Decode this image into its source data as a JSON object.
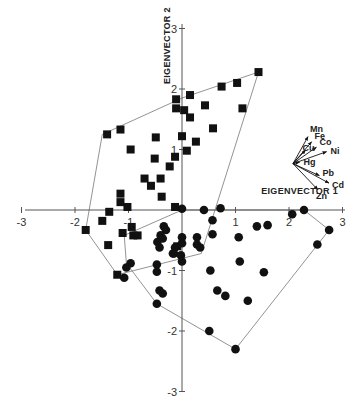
{
  "chart_data": {
    "type": "scatter",
    "title": "",
    "xlabel": "EIGENVECTOR 1",
    "ylabel": "EIGENVECTOR 2",
    "xlim": [
      -3,
      3
    ],
    "ylim": [
      -3,
      3
    ],
    "x_ticks": [
      "-3",
      "-2",
      "-1",
      "1",
      "2",
      "3"
    ],
    "y_ticks": [
      "3",
      "2",
      "1",
      "-1",
      "-2",
      "-3"
    ],
    "grid": false,
    "legend": null,
    "series": [
      {
        "name": "group-squares",
        "marker": "square",
        "points": [
          [
            1.43,
            2.28
          ],
          [
            1.03,
            2.1
          ],
          [
            0.74,
            2.04
          ],
          [
            0.15,
            1.9
          ],
          [
            0.43,
            1.73
          ],
          [
            1.13,
            1.68
          ],
          [
            0.04,
            1.65
          ],
          [
            0.15,
            1.53
          ],
          [
            0.58,
            1.35
          ],
          [
            0.0,
            1.22
          ],
          [
            0.26,
            1.13
          ],
          [
            0.09,
            0.98
          ],
          [
            -0.11,
            1.83
          ],
          [
            -0.11,
            1.68
          ],
          [
            -1.4,
            1.25
          ],
          [
            -1.15,
            1.33
          ],
          [
            -0.49,
            1.2
          ],
          [
            -0.96,
            1.0
          ],
          [
            -0.51,
            0.85
          ],
          [
            -0.13,
            0.88
          ],
          [
            -0.23,
            0.72
          ],
          [
            -0.7,
            0.52
          ],
          [
            -0.58,
            0.4
          ],
          [
            -0.4,
            0.52
          ],
          [
            -0.38,
            0.22
          ],
          [
            -1.15,
            0.27
          ],
          [
            -1.15,
            0.13
          ],
          [
            -1.02,
            0.05
          ],
          [
            -1.36,
            -0.03
          ],
          [
            -0.13,
            0.05
          ],
          [
            -1.49,
            -0.18
          ],
          [
            -1.8,
            -0.33
          ],
          [
            -0.94,
            -0.28
          ],
          [
            -0.91,
            -0.42
          ],
          [
            -0.83,
            -0.42
          ],
          [
            -1.11,
            -0.38
          ],
          [
            -1.38,
            -0.58
          ],
          [
            -1.21,
            -1.07
          ],
          [
            -0.09,
            -0.6
          ]
        ]
      },
      {
        "name": "group-circles",
        "marker": "circle",
        "points": [
          [
            0.0,
            0.02
          ],
          [
            0.41,
            0.0
          ],
          [
            0.72,
            0.03
          ],
          [
            2.06,
            -0.07
          ],
          [
            2.28,
            0.0
          ],
          [
            2.75,
            -0.33
          ],
          [
            2.53,
            -0.57
          ],
          [
            1.4,
            -0.27
          ],
          [
            1.6,
            -0.25
          ],
          [
            0.57,
            -0.17
          ],
          [
            0.57,
            -0.4
          ],
          [
            1.06,
            -0.45
          ],
          [
            0.0,
            -0.55
          ],
          [
            0.28,
            -0.57
          ],
          [
            0.34,
            -0.62
          ],
          [
            0.0,
            -0.45
          ],
          [
            0.28,
            -0.45
          ],
          [
            0.53,
            -1.0
          ],
          [
            1.08,
            -0.85
          ],
          [
            1.53,
            -1.03
          ],
          [
            0.66,
            -1.33
          ],
          [
            0.81,
            -1.42
          ],
          [
            1.23,
            -1.5
          ],
          [
            0.51,
            -2.0
          ],
          [
            1.0,
            -2.3
          ],
          [
            -0.34,
            -0.27
          ],
          [
            -0.3,
            -0.33
          ],
          [
            -0.4,
            -0.42
          ],
          [
            -0.36,
            -0.47
          ],
          [
            -0.46,
            -0.53
          ],
          [
            -0.42,
            -0.62
          ],
          [
            -0.15,
            -0.72
          ],
          [
            -0.02,
            -0.75
          ],
          [
            0.0,
            -0.85
          ],
          [
            -0.47,
            -0.9
          ],
          [
            -0.96,
            -0.88
          ],
          [
            -1.04,
            -0.95
          ],
          [
            -1.08,
            -1.12
          ],
          [
            -0.47,
            -1.02
          ],
          [
            -0.42,
            -1.33
          ],
          [
            -0.36,
            -1.38
          ],
          [
            -0.47,
            -1.55
          ],
          [
            -0.13,
            -0.62
          ],
          [
            -0.17,
            -0.72
          ]
        ]
      }
    ],
    "hulls": [
      {
        "name": "squares-hull",
        "vertices": [
          [
            -1.49,
            1.25
          ],
          [
            0.0,
            1.85
          ],
          [
            1.43,
            2.28
          ],
          [
            0.36,
            -0.72
          ],
          [
            -1.21,
            -1.07
          ],
          [
            -1.8,
            -0.33
          ]
        ]
      },
      {
        "name": "circles-hull",
        "vertices": [
          [
            -1.08,
            -0.42
          ],
          [
            0.0,
            0.0
          ],
          [
            2.28,
            0.0
          ],
          [
            2.75,
            -0.33
          ],
          [
            1.0,
            -2.3
          ],
          [
            -0.47,
            -1.55
          ],
          [
            -1.04,
            -0.88
          ]
        ]
      }
    ],
    "loading_vectors": {
      "origin": [
        2.0,
        0.7
      ],
      "vectors": [
        {
          "label": "Mn",
          "dx": 0.5,
          "dy": 0.9
        },
        {
          "label": "Fe",
          "dx": 0.62,
          "dy": 0.73
        },
        {
          "label": "Co",
          "dx": 0.78,
          "dy": 0.55
        },
        {
          "label": "Cu",
          "dx": 0.42,
          "dy": 0.45
        },
        {
          "label": "Ni",
          "dx": 1.12,
          "dy": 0.4
        },
        {
          "label": "Hg",
          "dx": 0.22,
          "dy": 0.05
        },
        {
          "label": "Pb",
          "dx": 0.88,
          "dy": -0.4
        },
        {
          "label": "Cd",
          "dx": 1.2,
          "dy": -0.65
        },
        {
          "label": "Zn",
          "dx": 0.83,
          "dy": -0.87
        }
      ]
    }
  }
}
